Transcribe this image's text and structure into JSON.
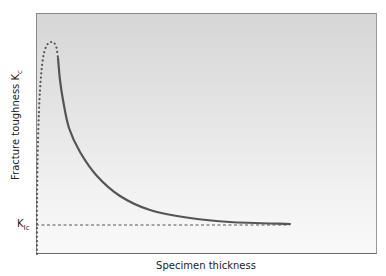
{
  "chart_data": {
    "type": "line",
    "title": "",
    "xlabel": "Specimen thickness",
    "ylabel": "Fracture toughness K",
    "ylabel_subscript": "c",
    "grid": false,
    "legend": null,
    "axes": {
      "x_ticks": [],
      "y_ticks": []
    },
    "annotations": [
      {
        "label": "K",
        "subscript": "Ic",
        "type": "horizontal-dashed-line",
        "description": "Plane-strain fracture toughness asymptote"
      }
    ],
    "series": [
      {
        "name": "Kc (rising, dotted — thin specimen region)",
        "style": "dotted",
        "color": "#555555",
        "points_px": [
          [
            37,
            254
          ],
          [
            37,
            200
          ],
          [
            38,
            140
          ],
          [
            40,
            90
          ],
          [
            43,
            58
          ],
          [
            47,
            45
          ],
          [
            52,
            42
          ],
          [
            56,
            46
          ],
          [
            58,
            58
          ]
        ]
      },
      {
        "name": "Kc (decreasing, solid)",
        "style": "solid",
        "color": "#555555",
        "points_px": [
          [
            58,
            58
          ],
          [
            60,
            80
          ],
          [
            63,
            100
          ],
          [
            69,
            128
          ],
          [
            80,
            152
          ],
          [
            97,
            176
          ],
          [
            120,
            196
          ],
          [
            150,
            210
          ],
          [
            190,
            218
          ],
          [
            230,
            222
          ],
          [
            290,
            224
          ]
        ]
      },
      {
        "name": "KIc",
        "style": "dashed",
        "color": "#444444",
        "points_px": [
          [
            36,
            225
          ],
          [
            290,
            225
          ]
        ]
      }
    ]
  },
  "labels": {
    "y_axis_main": "Fracture toughness K",
    "y_axis_sub": "c",
    "x_axis": "Specimen thickness",
    "kic_main": "K",
    "kic_sub": "Ic"
  }
}
